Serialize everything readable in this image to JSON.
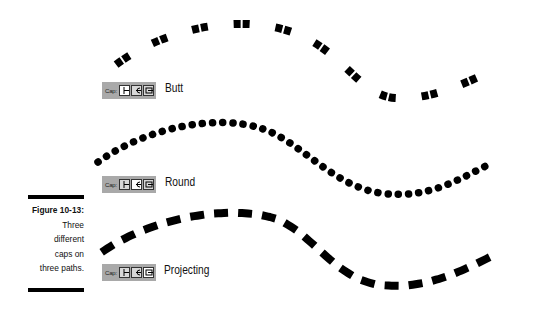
{
  "figure": {
    "number": "Figure 10-13:",
    "caption_lines": [
      "Three",
      "different",
      "caps on",
      "three paths."
    ]
  },
  "cap_panels": [
    {
      "label": "Cap:",
      "selected": "butt",
      "name": "Butt"
    },
    {
      "label": "Cap:",
      "selected": "round",
      "name": "Round"
    },
    {
      "label": "Cap:",
      "selected": "projecting",
      "name": "Projecting"
    }
  ],
  "paths": [
    {
      "cap": "butt",
      "stroke_color": "#000000",
      "dash_style": "paired squares"
    },
    {
      "cap": "round",
      "stroke_color": "#000000",
      "dash_style": "dots"
    },
    {
      "cap": "projecting",
      "stroke_color": "#000000",
      "dash_style": "dashes"
    }
  ],
  "colors": {
    "ink": "#000000",
    "panel": "#a9a9a9",
    "background": "#ffffff"
  }
}
